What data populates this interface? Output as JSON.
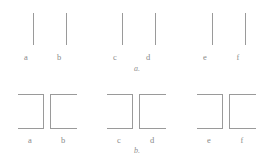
{
  "figure": {
    "background_color": "#ffffff",
    "stroke_color": "#9a9a9a",
    "label_color": "#8a8a8a",
    "width": 274,
    "height": 166
  },
  "panels": [
    {
      "id": "panel-a",
      "caption": "a.",
      "description": "Six vertical line segments arranged in three proximity pairs",
      "labels": [
        "a",
        "b",
        "c",
        "d",
        "e",
        "f"
      ],
      "label_x": [
        26,
        59,
        115,
        148,
        205,
        238
      ],
      "label_y": 50,
      "elements": [
        {
          "name": "line-a",
          "x": 33,
          "y_top": 13,
          "y_bottom": 45
        },
        {
          "name": "line-b",
          "x": 66,
          "y_top": 13,
          "y_bottom": 45
        },
        {
          "name": "line-c",
          "x": 122,
          "y_top": 13,
          "y_bottom": 45
        },
        {
          "name": "line-d",
          "x": 155,
          "y_top": 13,
          "y_bottom": 45
        },
        {
          "name": "line-e",
          "x": 212,
          "y_top": 13,
          "y_bottom": 45
        },
        {
          "name": "line-f",
          "x": 245,
          "y_top": 13,
          "y_bottom": 45
        }
      ]
    },
    {
      "id": "panel-b",
      "caption": "b.",
      "description": "Six open bracket shapes with alternating left and right openings",
      "labels": [
        "a",
        "b",
        "c",
        "d",
        "e",
        "f"
      ],
      "label_x": [
        26,
        59,
        115,
        148,
        205,
        238
      ],
      "label_y": 50,
      "elements": [
        {
          "name": "bracket-a",
          "opening": "left",
          "x_left": 17,
          "x_right": 43,
          "y_top": 11,
          "y_bottom": 45
        },
        {
          "name": "bracket-b",
          "opening": "right",
          "x_left": 50,
          "x_right": 76,
          "y_top": 11,
          "y_bottom": 45
        },
        {
          "name": "bracket-c",
          "opening": "left",
          "x_left": 106,
          "x_right": 132,
          "y_top": 11,
          "y_bottom": 45
        },
        {
          "name": "bracket-d",
          "opening": "right",
          "x_left": 139,
          "x_right": 165,
          "y_top": 11,
          "y_bottom": 45
        },
        {
          "name": "bracket-e",
          "opening": "left",
          "x_left": 196,
          "x_right": 222,
          "y_top": 11,
          "y_bottom": 45
        },
        {
          "name": "bracket-f",
          "opening": "right",
          "x_left": 229,
          "x_right": 255,
          "y_top": 11,
          "y_bottom": 45
        }
      ]
    }
  ]
}
